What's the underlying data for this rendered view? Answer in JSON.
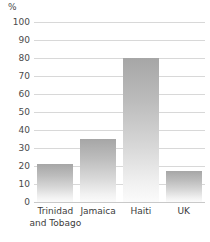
{
  "chart_data": {
    "type": "bar",
    "title": "",
    "subtitle": "",
    "xlabel": "",
    "ylabel": "%",
    "unit_label": "%",
    "categories": [
      "Trinidad and Tobago",
      "Jamaica",
      "Haiti",
      "UK"
    ],
    "values": [
      21,
      35,
      80,
      17
    ],
    "ylim": [
      0,
      100
    ],
    "ytick_step": 10,
    "yticks": [
      0,
      10,
      20,
      30,
      40,
      50,
      60,
      70,
      80,
      90,
      100
    ],
    "ytick_labels": [
      "0",
      "10",
      "20",
      "30",
      "40",
      "50",
      "60",
      "70",
      "80",
      "90",
      "100"
    ],
    "grid": true,
    "grid_axis": "y",
    "legend": false,
    "legend_position": "none",
    "series": [
      {
        "name": "",
        "values": [
          21,
          35,
          80,
          17
        ]
      }
    ],
    "colors": {
      "bar_top": "#a6a6a6",
      "bar_bottom": "#fbfbfb",
      "gridline": "#d8d8d8",
      "axis": "#c9c9c9",
      "text": "#3b3b3b",
      "background": "#ffffff"
    }
  },
  "labels": {
    "cat_0": "Trinidad\nand Tobago",
    "cat_1": "Jamaica",
    "cat_2": "Haiti",
    "cat_3": "UK"
  }
}
